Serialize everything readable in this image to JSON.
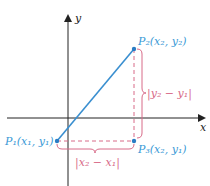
{
  "colors": {
    "segment": "#3a8fd0",
    "point": "#2a7cc4",
    "label_point": "#3a9ad6",
    "difference": "#d86a88",
    "axis": "#222222"
  },
  "axes": {
    "x_label": "x",
    "y_label": "y"
  },
  "points": {
    "p1": {
      "name": "P",
      "sub": "1",
      "coords": "(x₁, y₁)",
      "text": "P₁(x₁, y₁)"
    },
    "p2": {
      "name": "P",
      "sub": "2",
      "coords": "(x₂, y₂)",
      "text": "P₂(x₂, y₂)"
    },
    "p3": {
      "name": "P",
      "sub": "3",
      "coords": "(x₂, y₁)",
      "text": "P₃(x₂, y₁)"
    }
  },
  "differences": {
    "horizontal": "|x₂ − x₁|",
    "vertical": "|y₂ − y₁|"
  }
}
